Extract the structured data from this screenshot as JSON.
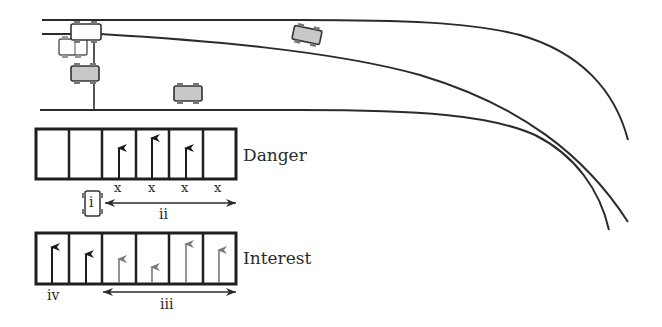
{
  "diagram": {
    "type": "road-lane-danger-interest-map",
    "road": {
      "lanes": 2,
      "lines": [
        "top-edge",
        "lane-divider",
        "bottom-edge"
      ],
      "curve_direction": "right-downward"
    },
    "cars": [
      {
        "name": "ego-car",
        "fill": "#ffffff"
      },
      {
        "name": "ghost-car",
        "fill": "#ffffff"
      },
      {
        "name": "left-lane-car",
        "fill": "#c8c8c8"
      },
      {
        "name": "ahead-car-lower",
        "fill": "#c8c8c8"
      },
      {
        "name": "ahead-car-upper",
        "fill": "#c8c8c8"
      }
    ],
    "danger_row": {
      "title": "Danger",
      "cells": [
        {
          "index": 0,
          "arrow": null,
          "mark": ""
        },
        {
          "index": 1,
          "arrow": null,
          "mark": ""
        },
        {
          "index": 2,
          "arrow": {
            "length": 0.6,
            "color": "#1a1a1a"
          },
          "mark": "x"
        },
        {
          "index": 3,
          "arrow": {
            "length": 0.8,
            "color": "#1a1a1a"
          },
          "mark": "x"
        },
        {
          "index": 4,
          "arrow": {
            "length": 0.6,
            "color": "#1a1a1a"
          },
          "mark": "x"
        },
        {
          "index": 5,
          "arrow": null,
          "mark": "x"
        }
      ],
      "car_label": "i",
      "range_label": "ii"
    },
    "interest_row": {
      "title": "Interest",
      "cells": [
        {
          "index": 0,
          "arrow": {
            "length": 0.75,
            "color": "#1a1a1a"
          }
        },
        {
          "index": 1,
          "arrow": {
            "length": 0.6,
            "color": "#1a1a1a"
          }
        },
        {
          "index": 2,
          "arrow": {
            "length": 0.5,
            "color": "#7a7a7a"
          }
        },
        {
          "index": 3,
          "arrow": {
            "length": 0.35,
            "color": "#7a7a7a"
          }
        },
        {
          "index": 4,
          "arrow": {
            "length": 0.8,
            "color": "#7a7a7a"
          }
        },
        {
          "index": 5,
          "arrow": {
            "length": 0.7,
            "color": "#7a7a7a"
          }
        }
      ],
      "left_label": "iv",
      "range_label": "iii"
    },
    "colors": {
      "line": "#2b2b2b",
      "car_gray": "#c8c8c8",
      "arrow_dark": "#1a1a1a",
      "arrow_gray": "#7a7a7a"
    }
  }
}
